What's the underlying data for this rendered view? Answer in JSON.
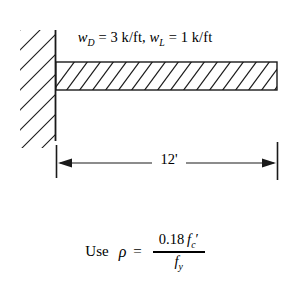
{
  "figure": {
    "stroke_color": "#1a1a1a",
    "background": "#ffffff",
    "load_label": {
      "dead_load_symbol": "w",
      "dead_load_subscript": "D",
      "dead_load_value": "3 k/ft",
      "live_load_symbol": "w",
      "live_load_subscript": "L",
      "live_load_value": "1 k/ft",
      "separator": ", ",
      "equals": "=",
      "full_text": "wD = 3 k/ft, wL = 1 k/ft"
    },
    "dimension": {
      "label": "12'",
      "value": 12,
      "unit": "ft"
    },
    "support": {
      "type": "fixed-wall",
      "hatch_angle_deg": 45
    },
    "beam": {
      "hatch_pattern": "diagonal",
      "hatch_angle_deg": 45
    }
  },
  "formula": {
    "lead_word": "Use",
    "symbol": "ρ",
    "equals": "=",
    "numerator_coefficient": "0.18",
    "numerator_symbol": "f",
    "numerator_subscript": "c",
    "numerator_prime": "′",
    "denominator_symbol": "f",
    "denominator_subscript": "y",
    "full_text": "Use ρ = 0.18 f'c / fy"
  }
}
